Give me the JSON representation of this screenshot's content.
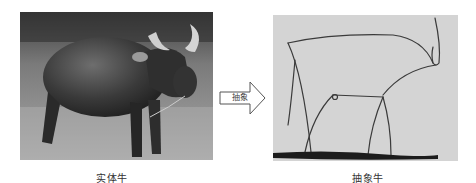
{
  "figure": {
    "left_panel": {
      "subject": "water-buffalo-photo",
      "caption": "实体牛"
    },
    "arrow": {
      "label": "抽象",
      "direction": "right"
    },
    "right_panel": {
      "subject": "bull-line-drawing",
      "caption": "抽象牛"
    }
  },
  "colors": {
    "background": "#ffffff",
    "drawing_paper": "#d6d6d6",
    "ink": "#3a3a3a",
    "caption_text": "#333333"
  }
}
